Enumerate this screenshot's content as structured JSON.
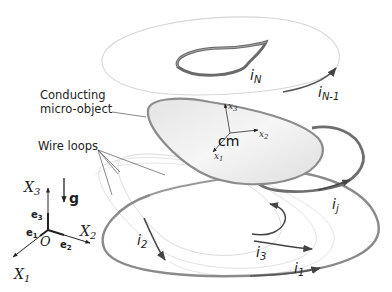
{
  "labels": {
    "conducting_line1": "Conducting",
    "conducting_line2": "micro-object",
    "wire_loops": "Wire loops",
    "cm": "cm",
    "body_axes": {
      "x1": "x",
      "x1_sub": "1",
      "x2": "x",
      "x2_sub": "2",
      "x3": "x",
      "x3_sub": "3"
    },
    "global_axes": {
      "X1": "X",
      "X1_sub": "1",
      "X2": "X",
      "X2_sub": "2",
      "X3": "X",
      "X3_sub": "3",
      "origin": "O"
    },
    "unit_vectors": {
      "e1": "e",
      "e1_sub": "1",
      "e2": "e",
      "e2_sub": "2",
      "e3": "e",
      "e3_sub": "3"
    },
    "gravity": "g",
    "currents": {
      "iN": "i",
      "iN_sub": "N",
      "iN1": "i",
      "iN1_sub": "N-1",
      "ij": "i",
      "ij_sub": "j",
      "i1": "i",
      "i1_sub": "1",
      "i2": "i",
      "i2_sub": "2",
      "i3": "i",
      "i3_sub": "3"
    }
  },
  "colors": {
    "loop_dark": "#7a7a7a",
    "loop_light": "#d8d8d8",
    "object_fill": "#ececec",
    "object_edge": "#8c8c8c",
    "text": "#222222",
    "leader": "#555555"
  }
}
